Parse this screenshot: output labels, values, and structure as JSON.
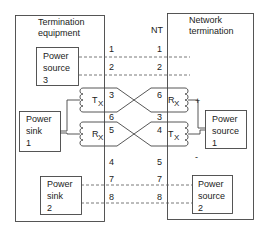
{
  "left_panel": {
    "title_line1": "Termination",
    "title_line2": "equipment"
  },
  "right_panel": {
    "title_line1": "Network",
    "title_line2": "termination",
    "nt_label": "NT"
  },
  "blocks": {
    "power_source_3": {
      "l1": "Power",
      "l2": "source",
      "l3": "3"
    },
    "power_sink_1": {
      "l1": "Power",
      "l2": "sink",
      "l3": "1"
    },
    "power_sink_2": {
      "l1": "Power",
      "l2": "sink",
      "l3": "2"
    },
    "power_source_1": {
      "l1": "Power",
      "l2": "source",
      "l3": "1"
    },
    "power_source_2": {
      "l1": "Power",
      "l2": "source",
      "l3": "2"
    }
  },
  "coils": {
    "left_top": {
      "label": "T",
      "sub": "X"
    },
    "left_bottom": {
      "label": "R",
      "sub": "X"
    },
    "right_top": {
      "label": "R",
      "sub": "X"
    },
    "right_bottom": {
      "label": "T",
      "sub": "X"
    }
  },
  "polarity": {
    "plus": "+",
    "minus": "-"
  },
  "pins_left": {
    "p1": "1",
    "p2": "2",
    "p3": "3",
    "p6": "6",
    "p5": "5",
    "p4": "4",
    "p7": "7",
    "p8": "8"
  },
  "pins_right": {
    "p1": "1",
    "p2": "2",
    "p6": "6",
    "p3": "3",
    "p4": "4",
    "p5": "5",
    "p7": "7",
    "p8": "8"
  }
}
